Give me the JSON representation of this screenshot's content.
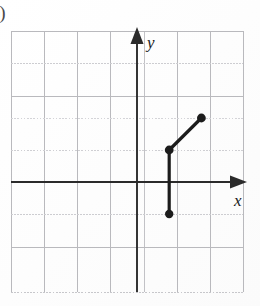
{
  "figure": {
    "item_label": "))",
    "axis_x_label": "x",
    "axis_y_label": "y",
    "background_color": "#ffffff",
    "grid_color": "#b9b9bd",
    "axis_color": "#2b2b2b",
    "plot_color": "#1c1c1c"
  },
  "chart_data": {
    "type": "line",
    "title": "",
    "xlabel": "x",
    "ylabel": "y",
    "grid": true,
    "legend": null,
    "xlim": [
      -4,
      3
    ],
    "ylim": [
      -3,
      4
    ],
    "xticks": [
      -4,
      -3,
      -2,
      -1,
      0,
      1,
      2,
      3
    ],
    "yticks": [
      -3,
      -2,
      -1,
      0,
      1,
      2,
      3,
      4
    ],
    "tick_labels_shown": false,
    "grid_spacing": 1,
    "series": [
      {
        "name": "vertical-segment",
        "points": [
          [
            1,
            -1
          ],
          [
            1,
            1
          ]
        ],
        "endpoint_style": "filled-circle"
      },
      {
        "name": "diagonal-segment",
        "points": [
          [
            1,
            1
          ],
          [
            2,
            2
          ]
        ],
        "endpoint_style": "filled-circle"
      }
    ],
    "marked_points": [
      {
        "x": 1,
        "y": -1,
        "filled": true
      },
      {
        "x": 1,
        "y": 1,
        "filled": true
      },
      {
        "x": 2,
        "y": 2,
        "filled": true
      }
    ],
    "annotations": []
  }
}
